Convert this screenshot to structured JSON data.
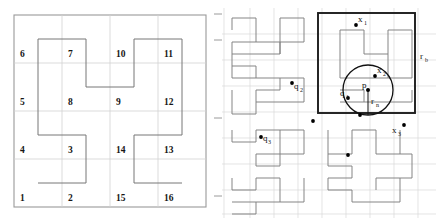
{
  "figure": {
    "title": "",
    "panels": [
      {
        "id": "left-panel",
        "name": "hilbert-curve-order-2-grid",
        "description": "4x4 grid with Hilbert curve ordering numbers",
        "grid_cols": 4,
        "grid_rows": 4,
        "cell_labels": [
          {
            "n": "6",
            "col": 0,
            "row": 0
          },
          {
            "n": "7",
            "col": 1,
            "row": 0
          },
          {
            "n": "10",
            "col": 2,
            "row": 0
          },
          {
            "n": "11",
            "col": 3,
            "row": 0
          },
          {
            "n": "5",
            "col": 0,
            "row": 1
          },
          {
            "n": "8",
            "col": 1,
            "row": 1
          },
          {
            "n": "9",
            "col": 2,
            "row": 1
          },
          {
            "n": "12",
            "col": 3,
            "row": 1
          },
          {
            "n": "4",
            "col": 0,
            "row": 2
          },
          {
            "n": "3",
            "col": 1,
            "row": 2
          },
          {
            "n": "14",
            "col": 2,
            "row": 2
          },
          {
            "n": "13",
            "col": 3,
            "row": 2
          },
          {
            "n": "1",
            "col": 0,
            "row": 3
          },
          {
            "n": "2",
            "col": 1,
            "row": 3
          },
          {
            "n": "15",
            "col": 2,
            "row": 3
          },
          {
            "n": "16",
            "col": 3,
            "row": 3
          }
        ]
      },
      {
        "id": "right-panel",
        "name": "hilbert-curve-order-3-query",
        "description": "Higher order Hilbert curve with query point, range circle and bounding box",
        "annotations": [
          {
            "key": "x1",
            "label": "x",
            "sub": "1"
          },
          {
            "key": "x2",
            "label": "x",
            "sub": "2"
          },
          {
            "key": "x3",
            "label": "x",
            "sub": "3"
          },
          {
            "key": "q1",
            "label": "q",
            "sub": "1"
          },
          {
            "key": "q2",
            "label": "q",
            "sub": "2"
          },
          {
            "key": "q3",
            "label": "q",
            "sub": "3"
          },
          {
            "key": "p",
            "label": "p",
            "sub": ""
          },
          {
            "key": "rn",
            "label": "r",
            "sub": "n"
          },
          {
            "key": "rb",
            "label": "r",
            "sub": "b"
          }
        ]
      }
    ]
  },
  "colors": {
    "curve": "#6f6f6f",
    "grid": "#cfcfcf",
    "border": "#9a9a9a",
    "bold_box": "#1c1c1c",
    "point": "#000000",
    "text": "#111111"
  }
}
